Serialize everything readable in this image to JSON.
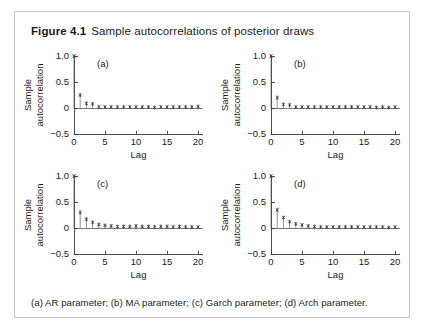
{
  "figure": {
    "number": "Figure 4.1",
    "title": "Sample autocorrelations of posterior draws",
    "caption": "(a) AR parameter; (b) MA parameter; (c) Garch parameter; (d) Arch parameter.",
    "border_color": "#c8c8c8",
    "axis_color": "#3a3a3a",
    "marker_color": "#2b2b2b"
  },
  "chart_data": [
    {
      "type": "line",
      "plot_style": "stem",
      "panel": "(a)",
      "title": "AR parameter",
      "xlabel": "Lag",
      "ylabel": "Sample autocorrelation",
      "ylabel_lines": [
        "Sample",
        "autocorrelation"
      ],
      "xlim": [
        0,
        20.8
      ],
      "ylim": [
        -0.5,
        1.0
      ],
      "xticks": [
        0,
        5,
        10,
        15,
        20
      ],
      "xticklabels": [
        "0",
        "5",
        "10",
        "15",
        "20"
      ],
      "yticks": [
        -0.5,
        0,
        0.5,
        1.0
      ],
      "yticklabels": [
        "−0.5",
        "0",
        "0.5",
        "1.0"
      ],
      "grid": false,
      "legend": false,
      "x": [
        0,
        1,
        2,
        3,
        4,
        5,
        6,
        7,
        8,
        9,
        10,
        11,
        12,
        13,
        14,
        15,
        16,
        17,
        18,
        19,
        20
      ],
      "values": [
        1.0,
        0.25,
        0.09,
        0.08,
        0.02,
        0.02,
        0.02,
        0.02,
        0.02,
        0.02,
        0.02,
        0.02,
        0.02,
        0.01,
        0.02,
        0.02,
        0.02,
        0.02,
        0.02,
        0.02,
        0.03
      ]
    },
    {
      "type": "line",
      "plot_style": "stem",
      "panel": "(b)",
      "title": "MA parameter",
      "xlabel": "Lag",
      "ylabel": "Sample autocorrelation",
      "ylabel_lines": [
        "Sample",
        "autocorrelation"
      ],
      "xlim": [
        0,
        20.8
      ],
      "ylim": [
        -0.5,
        1.0
      ],
      "xticks": [
        0,
        5,
        10,
        15,
        20
      ],
      "xticklabels": [
        "0",
        "5",
        "10",
        "15",
        "20"
      ],
      "yticks": [
        -0.5,
        0,
        0.5,
        1.0
      ],
      "yticklabels": [
        "−0.5",
        "0",
        "0.5",
        "1.0"
      ],
      "grid": false,
      "legend": false,
      "x": [
        0,
        1,
        2,
        3,
        4,
        5,
        6,
        7,
        8,
        9,
        10,
        11,
        12,
        13,
        14,
        15,
        16,
        17,
        18,
        19,
        20
      ],
      "values": [
        1.0,
        0.2,
        0.07,
        0.06,
        0.02,
        0.02,
        0.02,
        0.02,
        0.02,
        0.02,
        0.02,
        0.02,
        0.02,
        0.02,
        0.02,
        0.02,
        0.02,
        0.01,
        0.02,
        0.01,
        0.02
      ]
    },
    {
      "type": "line",
      "plot_style": "stem",
      "panel": "(c)",
      "title": "Garch parameter",
      "xlabel": "Lag",
      "ylabel": "Sample autocorrelation",
      "ylabel_lines": [
        "Sample",
        "autocorrelation"
      ],
      "xlim": [
        0,
        20.8
      ],
      "ylim": [
        -0.5,
        1.0
      ],
      "xticks": [
        0,
        5,
        10,
        15,
        20
      ],
      "xticklabels": [
        "0",
        "5",
        "10",
        "15",
        "20"
      ],
      "yticks": [
        -0.5,
        0,
        0.5,
        1.0
      ],
      "yticklabels": [
        "−0.5",
        "0",
        "0.5",
        "1.0"
      ],
      "grid": false,
      "legend": false,
      "x": [
        0,
        1,
        2,
        3,
        4,
        5,
        6,
        7,
        8,
        9,
        10,
        11,
        12,
        13,
        14,
        15,
        16,
        17,
        18,
        19,
        20
      ],
      "values": [
        1.0,
        0.3,
        0.17,
        0.11,
        0.07,
        0.05,
        0.04,
        0.03,
        0.03,
        0.03,
        0.04,
        0.03,
        0.03,
        0.02,
        0.03,
        0.03,
        0.02,
        0.03,
        0.02,
        0.02,
        0.02
      ]
    },
    {
      "type": "line",
      "plot_style": "stem",
      "panel": "(d)",
      "title": "Arch parameter",
      "xlabel": "Lag",
      "ylabel": "Sample autocorrelation",
      "ylabel_lines": [
        "Sample",
        "autocorrelation"
      ],
      "xlim": [
        0,
        20.8
      ],
      "ylim": [
        -0.5,
        1.0
      ],
      "xticks": [
        0,
        5,
        10,
        15,
        20
      ],
      "xticklabels": [
        "0",
        "5",
        "10",
        "15",
        "20"
      ],
      "yticks": [
        -0.5,
        0,
        0.5,
        1.0
      ],
      "yticklabels": [
        "−0.5",
        "0",
        "0.5",
        "1.0"
      ],
      "grid": false,
      "legend": false,
      "x": [
        0,
        1,
        2,
        3,
        4,
        5,
        6,
        7,
        8,
        9,
        10,
        11,
        12,
        13,
        14,
        15,
        16,
        17,
        18,
        19,
        20
      ],
      "values": [
        1.0,
        0.35,
        0.2,
        0.12,
        0.08,
        0.06,
        0.04,
        0.03,
        0.02,
        0.02,
        0.02,
        0.02,
        0.02,
        0.02,
        0.02,
        0.02,
        0.02,
        0.02,
        0.02,
        0.01,
        0.02
      ]
    }
  ]
}
